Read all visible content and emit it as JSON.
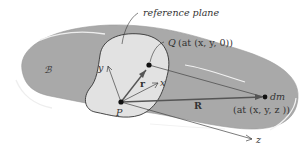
{
  "diagram": {
    "body_label": "ℬ",
    "plane_label": "reference plane",
    "point_Q": {
      "name": "Q",
      "coords": "(at (x, y, 0))"
    },
    "point_P": {
      "name": "P"
    },
    "point_dm": {
      "name": "dm",
      "coords": "(at (x, y, z ))"
    },
    "vectors": {
      "r": "r",
      "R": "R"
    },
    "axes": {
      "x": "x",
      "y": "y",
      "z": "z"
    },
    "colors": {
      "body_fill": "#a9a9a9",
      "plane_fill": "#e2e2e2",
      "outline": "#333333",
      "highlight": "#f0f0f0"
    }
  }
}
